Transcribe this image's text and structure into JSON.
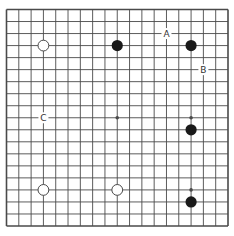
{
  "diagram": {
    "type": "go-board",
    "size": 19,
    "colors": {
      "background": "#ffffff",
      "grid": "#4a4a4a",
      "black_stone": "#1a1a1a",
      "white_stone_fill": "#ffffff",
      "white_stone_stroke": "#4a4a4a"
    },
    "star_points": [
      [
        3,
        3
      ],
      [
        9,
        3
      ],
      [
        15,
        3
      ],
      [
        3,
        9
      ],
      [
        9,
        9
      ],
      [
        15,
        9
      ],
      [
        3,
        15
      ],
      [
        9,
        15
      ],
      [
        15,
        15
      ]
    ],
    "stones": [
      {
        "color": "white",
        "col": 3,
        "row": 3
      },
      {
        "color": "black",
        "col": 9,
        "row": 3
      },
      {
        "color": "black",
        "col": 15,
        "row": 3
      },
      {
        "color": "black",
        "col": 15,
        "row": 10
      },
      {
        "color": "white",
        "col": 3,
        "row": 15
      },
      {
        "color": "white",
        "col": 9,
        "row": 15
      },
      {
        "color": "black",
        "col": 15,
        "row": 16
      }
    ],
    "labels": [
      {
        "text": "A",
        "col": 13,
        "row": 2
      },
      {
        "text": "B",
        "col": 16,
        "row": 5
      },
      {
        "text": "C",
        "col": 3,
        "row": 9
      }
    ]
  }
}
